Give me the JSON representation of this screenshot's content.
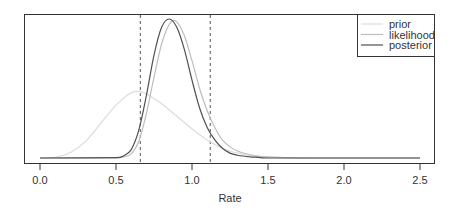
{
  "chart_data": {
    "type": "line",
    "title": "",
    "xlabel": "Rate",
    "ylabel": "",
    "xlim": [
      0.0,
      2.5
    ],
    "ylim": [
      0,
      1.0
    ],
    "y_units": "relative density (posterior peak = 1)",
    "grid": false,
    "y_axis_shown": false,
    "x_ticks": [
      0.0,
      0.5,
      1.0,
      1.5,
      2.0,
      2.5
    ],
    "x_tick_labels": [
      "0.0",
      "0.5",
      "1.0",
      "1.5",
      "2.0",
      "2.5"
    ],
    "legend": {
      "placement": "top-right",
      "entries": [
        "prior",
        "likelihood",
        "posterior"
      ]
    },
    "vlines": [
      {
        "x": 0.66,
        "style": "dashed",
        "color": "#555555"
      },
      {
        "x": 1.12,
        "style": "dashed",
        "color": "#555555"
      }
    ],
    "series": [
      {
        "name": "prior",
        "color": "#dcdcdc",
        "x": [
          0.0,
          0.1,
          0.2,
          0.3,
          0.4,
          0.5,
          0.6,
          0.65,
          0.7,
          0.8,
          0.9,
          1.0,
          1.1,
          1.2,
          1.3,
          1.4,
          1.5,
          1.7,
          2.0,
          2.5
        ],
        "y": [
          0.0,
          0.005,
          0.04,
          0.12,
          0.25,
          0.38,
          0.47,
          0.48,
          0.46,
          0.39,
          0.3,
          0.21,
          0.13,
          0.07,
          0.035,
          0.015,
          0.006,
          0.0,
          0.0,
          0.0
        ]
      },
      {
        "name": "likelihood",
        "color": "#bdbdbd",
        "x": [
          0.0,
          0.5,
          0.55,
          0.6,
          0.65,
          0.7,
          0.75,
          0.8,
          0.85,
          0.88,
          0.9,
          0.95,
          1.0,
          1.05,
          1.1,
          1.15,
          1.2,
          1.25,
          1.3,
          1.4,
          1.5,
          1.6,
          1.8,
          2.5
        ],
        "y": [
          0.0,
          0.0,
          0.008,
          0.03,
          0.12,
          0.32,
          0.58,
          0.82,
          0.96,
          0.99,
          0.98,
          0.88,
          0.7,
          0.5,
          0.34,
          0.22,
          0.13,
          0.08,
          0.05,
          0.02,
          0.008,
          0.003,
          0.0,
          0.0
        ]
      },
      {
        "name": "posterior",
        "color": "#505050",
        "x": [
          0.0,
          0.5,
          0.55,
          0.6,
          0.65,
          0.7,
          0.75,
          0.8,
          0.85,
          0.9,
          0.95,
          1.0,
          1.05,
          1.1,
          1.15,
          1.2,
          1.25,
          1.3,
          1.4,
          1.5,
          2.5
        ],
        "y": [
          0.0,
          0.002,
          0.015,
          0.06,
          0.2,
          0.45,
          0.74,
          0.94,
          1.0,
          0.94,
          0.78,
          0.56,
          0.36,
          0.22,
          0.13,
          0.07,
          0.035,
          0.02,
          0.007,
          0.0,
          0.0
        ]
      }
    ]
  }
}
